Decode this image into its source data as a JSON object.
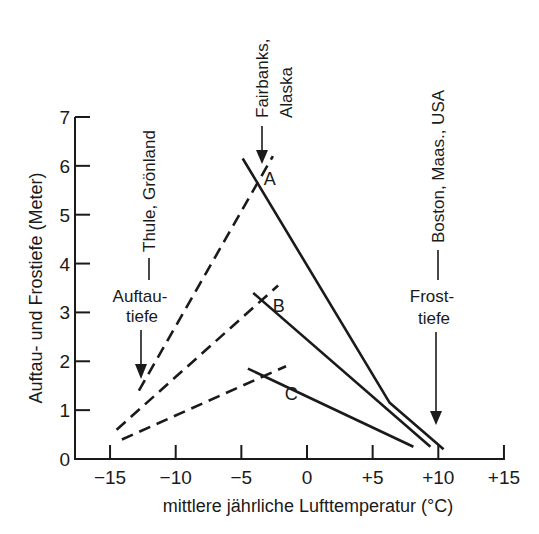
{
  "chart_data": {
    "type": "line",
    "title": "",
    "xlabel": "mittlere jährliche Lufttemperatur (°C)",
    "ylabel": "Auftau- und Frostiefe (Meter)",
    "xlim": [
      -17.5,
      16
    ],
    "ylim": [
      0,
      7
    ],
    "xticks": [
      -15,
      -10,
      -5,
      0,
      5,
      10,
      15
    ],
    "xtick_labels": [
      "−15",
      "−10",
      "−5",
      "0",
      "+5",
      "+10",
      "+15"
    ],
    "yticks": [
      0,
      1,
      2,
      3,
      4,
      5,
      6,
      7
    ],
    "ytick_labels": [
      "0",
      "1",
      "2",
      "3",
      "4",
      "5",
      "6",
      "7"
    ],
    "grid": false,
    "legend": "none (inline labels A, B, C)",
    "series": [
      {
        "name": "A Auftautiefe",
        "style": "dashed",
        "x": [
          -12.8,
          -2.6
        ],
        "y": [
          1.4,
          6.2
        ]
      },
      {
        "name": "A Frosttiefe",
        "style": "solid",
        "x": [
          -4.9,
          6.3,
          10.4
        ],
        "y": [
          6.15,
          1.15,
          0.2
        ]
      },
      {
        "name": "B Auftautiefe",
        "style": "dashed",
        "x": [
          -14.5,
          -2.2
        ],
        "y": [
          0.6,
          3.55
        ]
      },
      {
        "name": "B Frosttiefe",
        "style": "solid",
        "x": [
          -4.1,
          9.4
        ],
        "y": [
          3.4,
          0.25
        ]
      },
      {
        "name": "C Auftautiefe",
        "style": "dashed",
        "x": [
          -14.1,
          -1.6
        ],
        "y": [
          0.4,
          1.9
        ]
      },
      {
        "name": "C Frosttiefe",
        "style": "solid",
        "x": [
          -4.5,
          8.1
        ],
        "y": [
          1.85,
          0.25
        ]
      }
    ],
    "series_labels": [
      {
        "text": "A",
        "x": -3.3,
        "y": 5.6
      },
      {
        "text": "B",
        "x": -2.6,
        "y": 3.0
      },
      {
        "text": "C",
        "x": -1.7,
        "y": 1.2
      }
    ],
    "annotations": [
      {
        "text": "Thule, Grönland",
        "orientation": "vertical",
        "points_to": "Auftautiefe"
      },
      {
        "text": "Auftau-",
        "line2": "tiefe",
        "arrow_to_x": -12.5
      },
      {
        "text": "Fairbanks,",
        "line2": "Alaska",
        "orientation": "vertical",
        "arrow_to_x": -3.5
      },
      {
        "text": "Boston, Maas., USA",
        "orientation": "vertical"
      },
      {
        "text": "Frost-",
        "line2": "tiefe",
        "arrow_to_x": 9.9
      }
    ]
  },
  "colors": {
    "ink": "#1a1a1a",
    "background": "#ffffff"
  }
}
